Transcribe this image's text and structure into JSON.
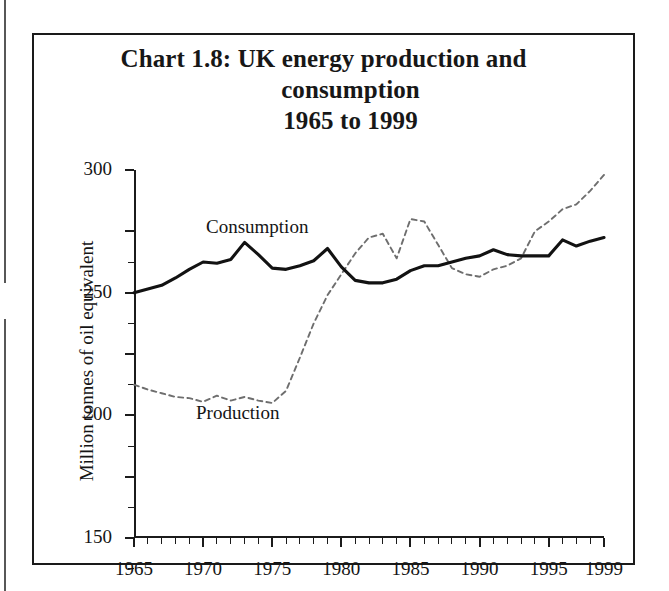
{
  "document": {
    "title_lines": [
      "Chart 1.8: UK energy production and",
      "consumption",
      "1965 to 1999"
    ]
  },
  "chart_data": {
    "type": "line",
    "title": "Chart 1.8: UK energy production and consumption 1965 to 1999",
    "xlabel": "",
    "ylabel": "Million tonnes of oil equivalent",
    "xlim": [
      1965,
      1999
    ],
    "ylim": [
      0,
      300
    ],
    "grid": false,
    "legend": "inline-annotations",
    "y_ticks": [
      0,
      50,
      100,
      150,
      200,
      250,
      300
    ],
    "y_tick_labels": [
      "0",
      "50",
      "100",
      "150",
      "200",
      "250",
      "300"
    ],
    "x_ticks": [
      1965,
      1970,
      1975,
      1980,
      1985,
      1990,
      1995,
      1999
    ],
    "x_tick_labels": [
      "1965",
      "1970",
      "1975",
      "1980",
      "1985",
      "1990",
      "1995",
      "1999"
    ],
    "x": [
      1965,
      1966,
      1967,
      1968,
      1969,
      1970,
      1971,
      1972,
      1973,
      1974,
      1975,
      1976,
      1977,
      1978,
      1979,
      1980,
      1981,
      1982,
      1983,
      1984,
      1985,
      1986,
      1987,
      1988,
      1989,
      1990,
      1991,
      1992,
      1993,
      1994,
      1995,
      1996,
      1997,
      1998,
      1999
    ],
    "series": [
      {
        "name": "Consumption",
        "style": "solid",
        "color": "#121212",
        "values": [
          200,
          203,
          206,
          212,
          219,
          225,
          224,
          227,
          241,
          231,
          220,
          219,
          222,
          226,
          236,
          221,
          210,
          208,
          208,
          211,
          218,
          222,
          222,
          225,
          228,
          230,
          235,
          231,
          230,
          230,
          230,
          243,
          238,
          242,
          245
        ]
      },
      {
        "name": "Production",
        "style": "dashed",
        "color": "#6e6e6e",
        "values": [
          125,
          121,
          118,
          115,
          114,
          111,
          116,
          112,
          115,
          112,
          110,
          120,
          147,
          175,
          198,
          215,
          232,
          245,
          248,
          228,
          260,
          258,
          239,
          220,
          215,
          213,
          219,
          222,
          228,
          250,
          258,
          268,
          272,
          283,
          296
        ]
      }
    ],
    "annotations": [
      {
        "text": "Consumption",
        "near_year": 1971,
        "near_value": 262
      },
      {
        "text": "Production",
        "near_year": 1971,
        "near_value": 92
      }
    ]
  },
  "axes": {
    "y_title": "Million tonnes of oil equivalent"
  }
}
